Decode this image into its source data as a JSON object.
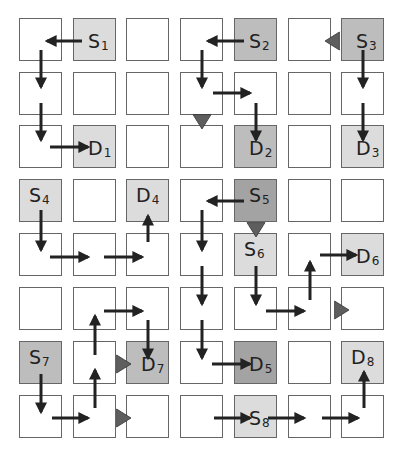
{
  "diagram": {
    "type": "grid routing diagram",
    "rows": 8,
    "cols": 7,
    "colors": {
      "cell_border": "#666666",
      "cell_empty": "#ffffff",
      "shade_light": "#dcdcdc",
      "shade_medium": "#bdbdbd",
      "shade_dark": "#a3a3a3",
      "arrow": "#222222",
      "triangle": "#5e5e5e"
    },
    "labels": [
      {
        "id": "S1",
        "letter": "S",
        "sub": "1",
        "row": 0,
        "col": 1,
        "shade": "light"
      },
      {
        "id": "S2",
        "letter": "S",
        "sub": "2",
        "row": 0,
        "col": 4,
        "shade": "medium"
      },
      {
        "id": "S3",
        "letter": "S",
        "sub": "3",
        "row": 0,
        "col": 6,
        "shade": "medium"
      },
      {
        "id": "D1",
        "letter": "D",
        "sub": "1",
        "row": 2,
        "col": 1,
        "shade": "light"
      },
      {
        "id": "D2",
        "letter": "D",
        "sub": "2",
        "row": 2,
        "col": 4,
        "shade": "medium"
      },
      {
        "id": "D3",
        "letter": "D",
        "sub": "3",
        "row": 2,
        "col": 6,
        "shade": "light"
      },
      {
        "id": "S4",
        "letter": "S",
        "sub": "4",
        "row": 3,
        "col": 0,
        "shade": "light"
      },
      {
        "id": "D4",
        "letter": "D",
        "sub": "4",
        "row": 3,
        "col": 2,
        "shade": "light"
      },
      {
        "id": "S5",
        "letter": "S",
        "sub": "5",
        "row": 3,
        "col": 4,
        "shade": "dark"
      },
      {
        "id": "S6",
        "letter": "S",
        "sub": "6",
        "row": 4,
        "col": 4,
        "shade": "light"
      },
      {
        "id": "D6",
        "letter": "D",
        "sub": "6",
        "row": 4,
        "col": 6,
        "shade": "light"
      },
      {
        "id": "S7",
        "letter": "S",
        "sub": "7",
        "row": 6,
        "col": 0,
        "shade": "medium"
      },
      {
        "id": "D7",
        "letter": "D",
        "sub": "7",
        "row": 6,
        "col": 2,
        "shade": "medium"
      },
      {
        "id": "D5",
        "letter": "D",
        "sub": "5",
        "row": 6,
        "col": 4,
        "shade": "dark"
      },
      {
        "id": "D8",
        "letter": "D",
        "sub": "8",
        "row": 6,
        "col": 6,
        "shade": "light"
      },
      {
        "id": "S8",
        "letter": "S",
        "sub": "8",
        "row": 7,
        "col": 4,
        "shade": "light"
      }
    ],
    "arrows": [
      {
        "x1": 82,
        "y1": 41,
        "x2": 47,
        "y2": 41
      },
      {
        "x1": 41,
        "y1": 50,
        "x2": 41,
        "y2": 87
      },
      {
        "x1": 41,
        "y1": 103,
        "x2": 41,
        "y2": 140
      },
      {
        "x1": 50,
        "y1": 147,
        "x2": 88,
        "y2": 147
      },
      {
        "x1": 244,
        "y1": 41,
        "x2": 208,
        "y2": 41
      },
      {
        "x1": 202,
        "y1": 50,
        "x2": 202,
        "y2": 87
      },
      {
        "x1": 213,
        "y1": 93,
        "x2": 250,
        "y2": 93
      },
      {
        "x1": 256,
        "y1": 103,
        "x2": 256,
        "y2": 140
      },
      {
        "x1": 363,
        "y1": 50,
        "x2": 363,
        "y2": 87
      },
      {
        "x1": 363,
        "y1": 103,
        "x2": 363,
        "y2": 140
      },
      {
        "x1": 244,
        "y1": 201,
        "x2": 208,
        "y2": 201
      },
      {
        "x1": 41,
        "y1": 210,
        "x2": 41,
        "y2": 250
      },
      {
        "x1": 50,
        "y1": 257,
        "x2": 88,
        "y2": 257
      },
      {
        "x1": 104,
        "y1": 257,
        "x2": 142,
        "y2": 257
      },
      {
        "x1": 148,
        "y1": 242,
        "x2": 148,
        "y2": 216
      },
      {
        "x1": 202,
        "y1": 210,
        "x2": 202,
        "y2": 250
      },
      {
        "x1": 202,
        "y1": 266,
        "x2": 202,
        "y2": 304
      },
      {
        "x1": 202,
        "y1": 320,
        "x2": 202,
        "y2": 358
      },
      {
        "x1": 212,
        "y1": 364,
        "x2": 250,
        "y2": 364
      },
      {
        "x1": 256,
        "y1": 266,
        "x2": 256,
        "y2": 304
      },
      {
        "x1": 266,
        "y1": 311,
        "x2": 304,
        "y2": 311
      },
      {
        "x1": 310,
        "y1": 300,
        "x2": 310,
        "y2": 262
      },
      {
        "x1": 320,
        "y1": 255,
        "x2": 356,
        "y2": 255
      },
      {
        "x1": 104,
        "y1": 311,
        "x2": 142,
        "y2": 311
      },
      {
        "x1": 148,
        "y1": 320,
        "x2": 148,
        "y2": 358
      },
      {
        "x1": 95,
        "y1": 355,
        "x2": 95,
        "y2": 316
      },
      {
        "x1": 95,
        "y1": 408,
        "x2": 95,
        "y2": 370
      },
      {
        "x1": 41,
        "y1": 374,
        "x2": 41,
        "y2": 412
      },
      {
        "x1": 52,
        "y1": 418,
        "x2": 88,
        "y2": 418
      },
      {
        "x1": 214,
        "y1": 418,
        "x2": 250,
        "y2": 418
      },
      {
        "x1": 268,
        "y1": 418,
        "x2": 304,
        "y2": 418
      },
      {
        "x1": 322,
        "y1": 418,
        "x2": 358,
        "y2": 418
      },
      {
        "x1": 364,
        "y1": 408,
        "x2": 364,
        "y2": 372
      }
    ],
    "triangles": [
      {
        "dir": "left",
        "cx": 334,
        "cy": 41
      },
      {
        "dir": "down",
        "cx": 202,
        "cy": 120
      },
      {
        "dir": "down",
        "cx": 256,
        "cy": 228
      },
      {
        "dir": "right",
        "cx": 340,
        "cy": 310
      },
      {
        "dir": "right",
        "cx": 122,
        "cy": 364
      },
      {
        "dir": "right",
        "cx": 122,
        "cy": 418
      }
    ]
  }
}
